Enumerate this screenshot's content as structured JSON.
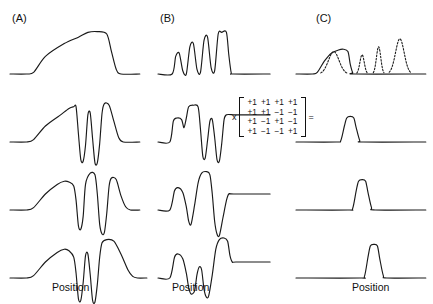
{
  "figure": {
    "panels": [
      {
        "id": "A",
        "label": "(A)",
        "axis_label": "Position"
      },
      {
        "id": "B",
        "label": "(B)",
        "axis_label": "Position"
      },
      {
        "id": "C",
        "label": "(C)",
        "axis_label": "Position"
      }
    ],
    "operator_multiply": "x",
    "operator_equals": "="
  },
  "matrix": {
    "name": "hadamard-4x4",
    "rows": [
      [
        "+1",
        "+1",
        "+1",
        "+1"
      ],
      [
        "+1",
        "+1",
        "−1",
        "−1"
      ],
      [
        "+1",
        "−1",
        "+1",
        "−1"
      ],
      [
        "+1",
        "−1",
        "−1",
        "+1"
      ]
    ]
  },
  "chart_data": {
    "type": "line",
    "title": "",
    "xlabel": "Position",
    "ylabel": "",
    "grid": false,
    "legend": null,
    "columns": [
      {
        "panel": "A",
        "description": "Composite encoded signals: broad ramp with downward notches",
        "traces": [
          {
            "row": 1,
            "style": "solid",
            "points": [
              [
                0,
                0
              ],
              [
                14,
                0
              ],
              [
                20,
                2
              ],
              [
                30,
                22
              ],
              [
                46,
                38
              ],
              [
                58,
                46
              ],
              [
                66,
                52
              ],
              [
                74,
                53
              ],
              [
                82,
                50
              ],
              [
                86,
                28
              ],
              [
                90,
                6
              ],
              [
                94,
                0
              ],
              [
                110,
                0
              ]
            ]
          },
          {
            "row": 2,
            "style": "solid",
            "points": [
              [
                0,
                0
              ],
              [
                14,
                0
              ],
              [
                20,
                3
              ],
              [
                30,
                20
              ],
              [
                42,
                33
              ],
              [
                50,
                42
              ],
              [
                54,
                44
              ],
              [
                56,
                44
              ],
              [
                58,
                10
              ],
              [
                60,
                -22
              ],
              [
                62,
                -24
              ],
              [
                64,
                -4
              ],
              [
                66,
                34
              ],
              [
                68,
                36
              ],
              [
                70,
                4
              ],
              [
                72,
                -26
              ],
              [
                74,
                -26
              ],
              [
                76,
                -2
              ],
              [
                78,
                36
              ],
              [
                80,
                48
              ],
              [
                84,
                46
              ],
              [
                88,
                26
              ],
              [
                92,
                6
              ],
              [
                96,
                0
              ],
              [
                110,
                0
              ]
            ]
          },
          {
            "row": 3,
            "style": "solid",
            "points": [
              [
                0,
                0
              ],
              [
                14,
                0
              ],
              [
                20,
                3
              ],
              [
                30,
                20
              ],
              [
                40,
                32
              ],
              [
                46,
                36
              ],
              [
                50,
                35
              ],
              [
                54,
                30
              ],
              [
                56,
                12
              ],
              [
                58,
                -20
              ],
              [
                60,
                -24
              ],
              [
                62,
                -8
              ],
              [
                64,
                32
              ],
              [
                68,
                46
              ],
              [
                72,
                44
              ],
              [
                74,
                20
              ],
              [
                76,
                -18
              ],
              [
                78,
                -30
              ],
              [
                80,
                -28
              ],
              [
                82,
                -4
              ],
              [
                84,
                30
              ],
              [
                86,
                40
              ],
              [
                90,
                38
              ],
              [
                94,
                18
              ],
              [
                98,
                4
              ],
              [
                102,
                0
              ],
              [
                110,
                0
              ]
            ]
          },
          {
            "row": 4,
            "style": "solid",
            "points": [
              [
                0,
                0
              ],
              [
                14,
                0
              ],
              [
                20,
                3
              ],
              [
                30,
                20
              ],
              [
                40,
                32
              ],
              [
                46,
                36
              ],
              [
                50,
                34
              ],
              [
                54,
                26
              ],
              [
                56,
                6
              ],
              [
                58,
                -26
              ],
              [
                60,
                -28
              ],
              [
                62,
                -6
              ],
              [
                64,
                28
              ],
              [
                66,
                30
              ],
              [
                68,
                4
              ],
              [
                70,
                -28
              ],
              [
                72,
                -30
              ],
              [
                74,
                -8
              ],
              [
                76,
                26
              ],
              [
                78,
                44
              ],
              [
                82,
                48
              ],
              [
                88,
                46
              ],
              [
                94,
                30
              ],
              [
                100,
                10
              ],
              [
                104,
                2
              ],
              [
                108,
                0
              ],
              [
                116,
                0
              ]
            ]
          }
        ]
      },
      {
        "panel": "B",
        "description": "Intermediate waveforms: comb of peaks and notched plateaus",
        "traces": [
          {
            "row": 1,
            "style": "solid",
            "points": [
              [
                0,
                0
              ],
              [
                12,
                0
              ],
              [
                15,
                22
              ],
              [
                18,
                26
              ],
              [
                21,
                4
              ],
              [
                24,
                0
              ],
              [
                27,
                34
              ],
              [
                30,
                38
              ],
              [
                33,
                6
              ],
              [
                36,
                2
              ],
              [
                39,
                42
              ],
              [
                42,
                46
              ],
              [
                45,
                8
              ],
              [
                48,
                4
              ],
              [
                51,
                50
              ],
              [
                54,
                52
              ],
              [
                58,
                52
              ],
              [
                60,
                24
              ],
              [
                62,
                2
              ],
              [
                64,
                0
              ],
              [
                95,
                0
              ]
            ]
          },
          {
            "row": 2,
            "style": "solid",
            "points": [
              [
                0,
                0
              ],
              [
                10,
                0
              ],
              [
                13,
                26
              ],
              [
                16,
                30
              ],
              [
                20,
                28
              ],
              [
                22,
                18
              ],
              [
                24,
                30
              ],
              [
                26,
                44
              ],
              [
                30,
                46
              ],
              [
                34,
                44
              ],
              [
                36,
                16
              ],
              [
                38,
                -18
              ],
              [
                40,
                -20
              ],
              [
                42,
                2
              ],
              [
                44,
                26
              ],
              [
                46,
                28
              ],
              [
                48,
                6
              ],
              [
                50,
                -22
              ],
              [
                52,
                -24
              ],
              [
                54,
                -2
              ],
              [
                56,
                28
              ],
              [
                58,
                34
              ],
              [
                64,
                34
              ],
              [
                68,
                34
              ],
              [
                95,
                34
              ]
            ]
          },
          {
            "row": 3,
            "style": "solid",
            "points": [
              [
                0,
                0
              ],
              [
                10,
                0
              ],
              [
                14,
                24
              ],
              [
                17,
                28
              ],
              [
                21,
                22
              ],
              [
                24,
                4
              ],
              [
                26,
                -14
              ],
              [
                28,
                -18
              ],
              [
                31,
                6
              ],
              [
                34,
                34
              ],
              [
                37,
                46
              ],
              [
                41,
                48
              ],
              [
                44,
                44
              ],
              [
                46,
                20
              ],
              [
                48,
                -14
              ],
              [
                50,
                -30
              ],
              [
                52,
                -32
              ],
              [
                55,
                -10
              ],
              [
                58,
                12
              ],
              [
                60,
                20
              ],
              [
                64,
                20
              ],
              [
                95,
                20
              ]
            ]
          },
          {
            "row": 4,
            "style": "solid",
            "points": [
              [
                0,
                0
              ],
              [
                10,
                0
              ],
              [
                14,
                26
              ],
              [
                17,
                30
              ],
              [
                21,
                24
              ],
              [
                24,
                6
              ],
              [
                26,
                -12
              ],
              [
                28,
                -20
              ],
              [
                31,
                -16
              ],
              [
                33,
                4
              ],
              [
                35,
                14
              ],
              [
                37,
                10
              ],
              [
                39,
                -14
              ],
              [
                41,
                -24
              ],
              [
                43,
                -22
              ],
              [
                46,
                4
              ],
              [
                49,
                36
              ],
              [
                52,
                48
              ],
              [
                56,
                50
              ],
              [
                59,
                46
              ],
              [
                61,
                28
              ],
              [
                63,
                20
              ],
              [
                66,
                20
              ],
              [
                95,
                20
              ]
            ]
          }
        ]
      },
      {
        "panel": "C",
        "description": "Decoded single peaks; row 1 overlays dashed component peaks of increasing height",
        "traces": [
          {
            "row": 1,
            "style": "solid",
            "points": [
              [
                0,
                0
              ],
              [
                14,
                0
              ],
              [
                18,
                2
              ],
              [
                24,
                16
              ],
              [
                30,
                26
              ],
              [
                36,
                30
              ],
              [
                40,
                31
              ],
              [
                44,
                28
              ],
              [
                46,
                12
              ],
              [
                48,
                2
              ],
              [
                50,
                0
              ],
              [
                110,
                0
              ]
            ],
            "overlays": [
              {
                "style": "dashed",
                "center": 32,
                "height": 28,
                "width": 22
              },
              {
                "style": "dashed",
                "center": 56,
                "height": 24,
                "width": 9
              },
              {
                "style": "dashed",
                "center": 70,
                "height": 34,
                "width": 9
              },
              {
                "style": "dashed",
                "center": 88,
                "height": 44,
                "width": 18
              }
            ]
          },
          {
            "row": 2,
            "style": "solid",
            "points": [
              [
                0,
                0
              ],
              [
                34,
                0
              ],
              [
                38,
                2
              ],
              [
                41,
                20
              ],
              [
                43,
                30
              ],
              [
                46,
                32
              ],
              [
                49,
                30
              ],
              [
                51,
                18
              ],
              [
                54,
                2
              ],
              [
                57,
                0
              ],
              [
                110,
                0
              ]
            ]
          },
          {
            "row": 3,
            "style": "solid",
            "points": [
              [
                0,
                0
              ],
              [
                44,
                0
              ],
              [
                48,
                2
              ],
              [
                51,
                24
              ],
              [
                53,
                36
              ],
              [
                56,
                38
              ],
              [
                59,
                36
              ],
              [
                61,
                22
              ],
              [
                64,
                3
              ],
              [
                67,
                0
              ],
              [
                110,
                0
              ]
            ]
          },
          {
            "row": 4,
            "style": "solid",
            "points": [
              [
                0,
                0
              ],
              [
                54,
                0
              ],
              [
                58,
                2
              ],
              [
                61,
                26
              ],
              [
                63,
                40
              ],
              [
                66,
                42
              ],
              [
                69,
                40
              ],
              [
                71,
                24
              ],
              [
                74,
                3
              ],
              [
                77,
                0
              ],
              [
                110,
                0
              ]
            ]
          }
        ]
      }
    ]
  },
  "style": {
    "stroke_color": "#1a1a1a",
    "background": "#ffffff",
    "stroke_width": 1.15
  }
}
